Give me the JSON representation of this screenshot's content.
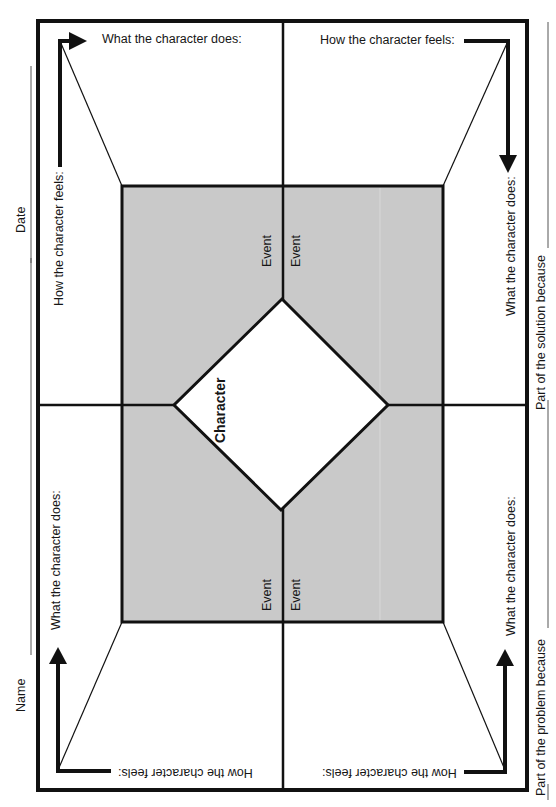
{
  "worksheet": {
    "header_fields": {
      "name_label": "Name",
      "date_label": "Date"
    },
    "footer_fields": {
      "problem_label": "Part of the problem because",
      "solution_label": "Part of the solution because"
    },
    "center": {
      "character_label": "Character",
      "event_labels": [
        "Event",
        "Event",
        "Event",
        "Event"
      ]
    },
    "quadrants": {
      "top_left": {
        "does_label": "What the character does:",
        "feels_label": "How the character feels:"
      },
      "top_right": {
        "feels_label": "How the character feels:",
        "does_label": "What the character does:"
      },
      "bottom_left": {
        "does_label": "What the character does:",
        "feels_label": "How the character feels:"
      },
      "bottom_right": {
        "does_label": "What the character does:",
        "feels_label": "How the character feels:"
      }
    },
    "colors": {
      "line": "#111111",
      "center_fill": "#c9c9c9",
      "diamond_fill": "#ffffff",
      "underline": "#555555"
    }
  }
}
